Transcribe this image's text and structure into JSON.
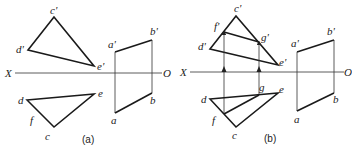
{
  "diagram": {
    "type": "descriptive-geometry-projection",
    "axis": {
      "left_label": "X",
      "right_label": "O"
    },
    "panels": [
      {
        "caption": "(a)",
        "front_triangle": {
          "labels": [
            "c'",
            "d'",
            "e'"
          ]
        },
        "top_triangle": {
          "labels": [
            "d",
            "e",
            "c",
            "f"
          ]
        },
        "quad": {
          "labels": [
            "a'",
            "b'",
            "b",
            "a"
          ]
        }
      },
      {
        "caption": "(b)",
        "front_triangle": {
          "labels": [
            "c'",
            "f'",
            "g'",
            "d'",
            "e'"
          ]
        },
        "top_triangle": {
          "labels": [
            "d",
            "g",
            "e",
            "f",
            "c"
          ]
        },
        "quad": {
          "labels": [
            "a'",
            "b'",
            "b",
            "a"
          ]
        }
      }
    ]
  }
}
